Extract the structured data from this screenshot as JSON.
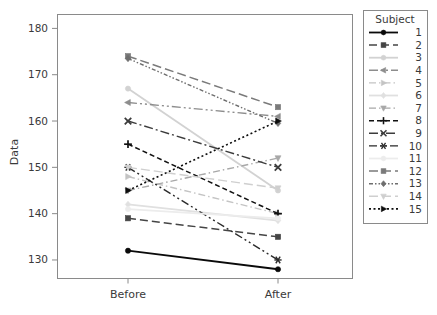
{
  "chart_data": {
    "type": "line",
    "title": "",
    "xlabel": "",
    "ylabel": "Data",
    "categories": [
      "Before",
      "After"
    ],
    "x": [
      "Before",
      "After"
    ],
    "ylim": [
      126,
      183
    ],
    "yticks": [
      130,
      140,
      150,
      160,
      170,
      180
    ],
    "ytick_labels": [
      "130",
      "140",
      "150",
      "160",
      "170",
      "180"
    ],
    "grid": false,
    "legend_position": "right-outside",
    "legend_title": "Subject",
    "series": [
      {
        "name": "1",
        "values": [
          132,
          128
        ],
        "color": "#0a0a0a",
        "dash": "none",
        "marker": "circle",
        "width": 1.8
      },
      {
        "name": "2",
        "values": [
          139,
          135
        ],
        "color": "#454545",
        "dash": "8,4",
        "marker": "square",
        "width": 1.5
      },
      {
        "name": "3",
        "values": [
          167,
          145
        ],
        "color": "#d2d2d2",
        "dash": "none",
        "marker": "circle",
        "width": 1.8
      },
      {
        "name": "4",
        "values": [
          164,
          161
        ],
        "color": "#8d8d8d",
        "dash": "9,3,2,3,2,3",
        "marker": "triangle-left",
        "width": 1.4
      },
      {
        "name": "5",
        "values": [
          148,
          140
        ],
        "color": "#c4c4c4",
        "dash": "7,3,1.5,3",
        "marker": "triangle-right",
        "width": 1.4
      },
      {
        "name": "6",
        "values": [
          142,
          138.5
        ],
        "color": "#e0e0e0",
        "dash": "none",
        "marker": "diamond",
        "width": 1.8
      },
      {
        "name": "7",
        "values": [
          145,
          152
        ],
        "color": "#a8a8a8",
        "dash": "7,3,1.5,3",
        "marker": "triangle-down",
        "width": 1.4
      },
      {
        "name": "8",
        "values": [
          155,
          140
        ],
        "color": "#111111",
        "dash": "5,3",
        "marker": "plus",
        "width": 1.5
      },
      {
        "name": "9",
        "values": [
          160,
          150
        ],
        "color": "#3c3c3c",
        "dash": "9,3,2,3",
        "marker": "x",
        "width": 1.4
      },
      {
        "name": "10",
        "values": [
          150,
          130
        ],
        "color": "#2a2a2a",
        "dash": "8,3,2,3,2,3",
        "marker": "asterisk",
        "width": 1.4
      },
      {
        "name": "11",
        "values": [
          141,
          139
        ],
        "color": "#ececec",
        "dash": "none",
        "marker": "circle",
        "width": 1.8
      },
      {
        "name": "12",
        "values": [
          174,
          163
        ],
        "color": "#7a7a7a",
        "dash": "9,4",
        "marker": "square",
        "width": 1.5
      },
      {
        "name": "13",
        "values": [
          173.5,
          159.5
        ],
        "color": "#6e6e6e",
        "dash": "4,2,1.5,2,1.5,2",
        "marker": "diamond",
        "width": 1.4
      },
      {
        "name": "14",
        "values": [
          150,
          145.5
        ],
        "color": "#cfcfcf",
        "dash": "9,4",
        "marker": "triangle-down",
        "width": 1.4
      },
      {
        "name": "15",
        "values": [
          145,
          160
        ],
        "color": "#0d0d0d",
        "dash": "2,2.5",
        "marker": "triangle-right",
        "width": 1.6
      }
    ],
    "annotations": []
  },
  "legend": {
    "title": "Subject",
    "items": [
      {
        "label": "1"
      },
      {
        "label": "2"
      },
      {
        "label": "3"
      },
      {
        "label": "4"
      },
      {
        "label": "5"
      },
      {
        "label": "6"
      },
      {
        "label": "7"
      },
      {
        "label": "8"
      },
      {
        "label": "9"
      },
      {
        "label": "10"
      },
      {
        "label": "11"
      },
      {
        "label": "12"
      },
      {
        "label": "13"
      },
      {
        "label": "14"
      },
      {
        "label": "15"
      }
    ]
  },
  "axes": {
    "y_title": "Data",
    "y_ticks": [
      "180",
      "170",
      "160",
      "150",
      "140",
      "130"
    ],
    "x_ticks": [
      "Before",
      "After"
    ]
  },
  "colors": {
    "frame": "#8a8a8a",
    "text": "#3a3a3a",
    "background": "#ffffff"
  }
}
